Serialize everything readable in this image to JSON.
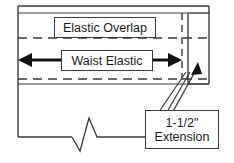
{
  "diagram": {
    "type": "technical-sewing-diagram",
    "background_color": "#ffffff",
    "line_color": "#3a3a3a",
    "text_color": "#1a1a1a",
    "labels": {
      "elastic_overlap": "Elastic Overlap",
      "waist_elastic": "Waist Elastic",
      "extension_measure": "1-1/2\"",
      "extension_word": "Extension"
    },
    "icons": {
      "left_arrow": "arrow-left",
      "right_arrow": "arrow-right",
      "leader_arrow": "leader-arrow-up",
      "break": "break-line-zigzag"
    }
  }
}
